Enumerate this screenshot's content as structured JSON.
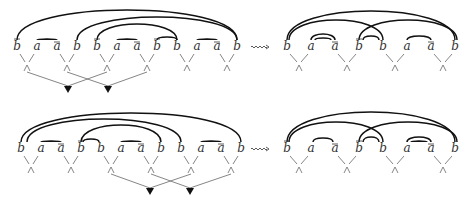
{
  "diagram": {
    "panels": [
      {
        "id": "top-left",
        "letters": [
          {
            "x": 17,
            "t": "b",
            "bar": true
          },
          {
            "x": 37,
            "t": "a",
            "bar": false
          },
          {
            "x": 57,
            "t": "a",
            "bar": true
          },
          {
            "x": 77,
            "t": "b",
            "bar": false
          },
          {
            "x": 97,
            "t": "b",
            "bar": true
          },
          {
            "x": 117,
            "t": "a",
            "bar": false
          },
          {
            "x": 137,
            "t": "a",
            "bar": true
          },
          {
            "x": 157,
            "t": "b",
            "bar": true
          },
          {
            "x": 177,
            "t": "b",
            "bar": false
          },
          {
            "x": 197,
            "t": "a",
            "bar": false
          },
          {
            "x": 217,
            "t": "a",
            "bar": true
          },
          {
            "x": 237,
            "t": "b",
            "bar": false
          }
        ],
        "letter_y": 50,
        "arcs": [
          [
            17,
            237,
            10
          ],
          [
            77,
            237,
            17
          ],
          [
            97,
            177,
            24
          ],
          [
            37,
            57,
            39
          ],
          [
            117,
            137,
            39
          ],
          [
            157,
            177,
            37
          ],
          [
            197,
            217,
            39
          ]
        ],
        "wedges": [
          27,
          67,
          107,
          147,
          187,
          227
        ],
        "wedge_y": 68,
        "triangles": [
          68,
          108
        ],
        "triangle_y": 90,
        "links": [
          [
            27,
            68
          ],
          [
            67,
            108
          ],
          [
            107,
            68
          ],
          [
            147,
            108
          ]
        ]
      },
      {
        "id": "top-right",
        "letters": [
          {
            "x": 287,
            "t": "b",
            "bar": false
          },
          {
            "x": 311,
            "t": "a",
            "bar": false
          },
          {
            "x": 335,
            "t": "a",
            "bar": true
          },
          {
            "x": 359,
            "t": "b",
            "bar": true
          },
          {
            "x": 383,
            "t": "b",
            "bar": false
          },
          {
            "x": 407,
            "t": "a",
            "bar": false
          },
          {
            "x": 431,
            "t": "a",
            "bar": true
          },
          {
            "x": 455,
            "t": "b",
            "bar": false
          }
        ],
        "letter_y": 50,
        "arcs": [
          [
            287,
            455,
            11
          ],
          [
            289,
            383,
            20
          ],
          [
            359,
            457,
            20
          ],
          [
            311,
            335,
            34
          ],
          [
            315,
            331,
            38
          ],
          [
            363,
            379,
            36
          ],
          [
            407,
            431,
            36
          ]
        ],
        "wedges": [
          299,
          347,
          395,
          443
        ],
        "wedge_y": 68,
        "triangles": [],
        "triangle_y": 0,
        "links": []
      },
      {
        "id": "bottom-left",
        "letters": [
          {
            "x": 21,
            "t": "b",
            "bar": false
          },
          {
            "x": 41,
            "t": "a",
            "bar": false
          },
          {
            "x": 61,
            "t": "a",
            "bar": true
          },
          {
            "x": 81,
            "t": "b",
            "bar": true
          },
          {
            "x": 101,
            "t": "b",
            "bar": false
          },
          {
            "x": 121,
            "t": "a",
            "bar": false
          },
          {
            "x": 141,
            "t": "a",
            "bar": true
          },
          {
            "x": 161,
            "t": "b",
            "bar": false
          },
          {
            "x": 181,
            "t": "b",
            "bar": false
          },
          {
            "x": 201,
            "t": "a",
            "bar": false
          },
          {
            "x": 221,
            "t": "a",
            "bar": true
          },
          {
            "x": 241,
            "t": "b",
            "bar": false
          }
        ],
        "letter_y": 152,
        "arcs": [
          [
            21,
            241,
            113
          ],
          [
            27,
            181,
            119
          ],
          [
            81,
            161,
            125
          ],
          [
            83,
            99,
            139
          ],
          [
            41,
            61,
            141
          ],
          [
            121,
            141,
            141
          ],
          [
            201,
            221,
            141
          ]
        ],
        "wedges": [
          31,
          71,
          111,
          151,
          191,
          231
        ],
        "wedge_y": 170,
        "triangles": [
          150,
          190
        ],
        "triangle_y": 192,
        "links": [
          [
            111,
            150
          ],
          [
            151,
            190
          ],
          [
            191,
            150
          ],
          [
            231,
            190
          ]
        ]
      },
      {
        "id": "bottom-right",
        "letters": [
          {
            "x": 287,
            "t": "b",
            "bar": true
          },
          {
            "x": 311,
            "t": "a",
            "bar": false
          },
          {
            "x": 335,
            "t": "a",
            "bar": true
          },
          {
            "x": 359,
            "t": "b",
            "bar": true
          },
          {
            "x": 383,
            "t": "b",
            "bar": false
          },
          {
            "x": 407,
            "t": "a",
            "bar": false
          },
          {
            "x": 431,
            "t": "a",
            "bar": true
          },
          {
            "x": 455,
            "t": "b",
            "bar": false
          }
        ],
        "letter_y": 152,
        "arcs": [
          [
            287,
            455,
            112
          ],
          [
            289,
            383,
            122
          ],
          [
            359,
            457,
            122
          ],
          [
            313,
            333,
            138
          ],
          [
            363,
            379,
            137
          ],
          [
            407,
            431,
            137
          ],
          [
            411,
            427,
            141
          ]
        ],
        "wedges": [
          299,
          347,
          395,
          443
        ],
        "wedge_y": 170,
        "triangles": [],
        "triangle_y": 0,
        "links": []
      }
    ],
    "rewrite_arrows": [
      {
        "x": 260,
        "y": 47,
        "symbol": "⇝"
      },
      {
        "x": 260,
        "y": 149,
        "symbol": "⇝"
      }
    ]
  }
}
